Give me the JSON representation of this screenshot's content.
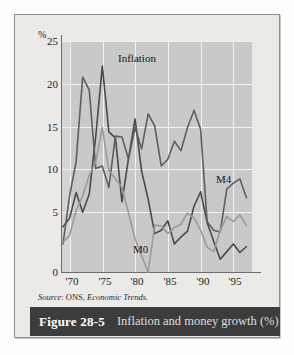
{
  "figure": {
    "caption_number": "Figure 28-5",
    "caption_text": "Inflation and money growth (%)",
    "source": "Source: ONS, Economic Trends.",
    "source_prefix": "Source",
    "source_rest": ": ONS, ",
    "source_publication": "Economic Trends."
  },
  "colors": {
    "plot_background": "#c9c9c9",
    "plot_background_left": "#d4d4d4",
    "gridline": "#f2f2f2",
    "axis": "#6e6e6e",
    "inflation_line": "#4a4a4a",
    "m4_line": "#5e5e5e",
    "m0_line": "#9a9a9a",
    "caption_bar": "#3c3c3c",
    "caption_number_color": "#ffffff",
    "caption_text_color": "#dedede",
    "frame_border": "#8d8d8d",
    "page_background": "#eceae7"
  },
  "chart_data": {
    "type": "line",
    "title": "Inflation and money growth (%)",
    "xlabel": "",
    "ylabel": "%",
    "ylim": [
      0,
      27
    ],
    "xlim": [
      1969,
      1998
    ],
    "yticks": [
      0,
      5,
      10,
      15,
      20,
      25
    ],
    "ytick_labels": [
      "0",
      "5",
      "10",
      "15",
      "20",
      "25"
    ],
    "xticks": [
      1970,
      1975,
      1980,
      1985,
      1990,
      1995
    ],
    "xtick_labels": [
      "'70",
      "'75",
      "'80",
      "'85",
      "'90",
      "'95"
    ],
    "grid": true,
    "legend": "inline-annotations",
    "annotations": [
      {
        "text": "Inflation",
        "x": 1976.5,
        "y": 24.2
      },
      {
        "text": "M4",
        "x": 1991.5,
        "y": 12.6
      },
      {
        "text": "M0",
        "x": 1979.0,
        "y": 4.0
      }
    ],
    "x": [
      1969,
      1970,
      1971,
      1972,
      1973,
      1974,
      1975,
      1976,
      1977,
      1978,
      1979,
      1980,
      1981,
      1982,
      1983,
      1984,
      1985,
      1986,
      1987,
      1988,
      1989,
      1990,
      1991,
      1992,
      1993,
      1994,
      1995,
      1996,
      1997
    ],
    "series": [
      {
        "name": "Inflation",
        "color": "#4a4a4a",
        "values": [
          5.4,
          6.4,
          9.4,
          7.1,
          9.2,
          16.0,
          24.2,
          16.5,
          15.8,
          8.3,
          13.4,
          18.0,
          11.9,
          8.6,
          4.6,
          5.0,
          6.1,
          3.4,
          4.2,
          4.9,
          7.8,
          9.5,
          5.9,
          3.7,
          1.6,
          2.5,
          3.4,
          2.4,
          3.1
        ]
      },
      {
        "name": "M4",
        "color": "#5e5e5e",
        "values": [
          3.4,
          9.0,
          13.0,
          22.9,
          21.4,
          12.2,
          12.5,
          10.0,
          16.0,
          15.9,
          13.3,
          17.0,
          14.5,
          18.6,
          17.2,
          12.5,
          13.3,
          15.4,
          14.3,
          17.0,
          19.0,
          16.8,
          6.0,
          5.0,
          4.8,
          9.8,
          10.5,
          11.0,
          8.8
        ]
      },
      {
        "name": "M0",
        "color": "#9a9a9a",
        "values": [
          3.6,
          4.4,
          7.3,
          9.0,
          11.4,
          13.0,
          17.0,
          12.0,
          11.0,
          10.0,
          7.0,
          4.0,
          2.0,
          0.1,
          5.6,
          5.5,
          4.6,
          5.3,
          5.7,
          7.0,
          6.4,
          5.0,
          3.0,
          2.5,
          5.0,
          6.6,
          6.0,
          6.8,
          5.5
        ]
      }
    ]
  }
}
